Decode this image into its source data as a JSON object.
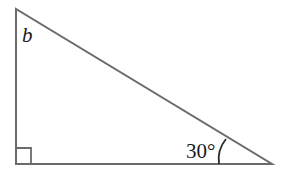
{
  "diagram": {
    "type": "right-triangle",
    "labels": {
      "top_angle": "b",
      "bottom_right_angle": "30°"
    },
    "right_angle_marker": "bottom-left",
    "colors": {
      "stroke": "#6b6b6b",
      "text": "#1a1a1a"
    }
  }
}
